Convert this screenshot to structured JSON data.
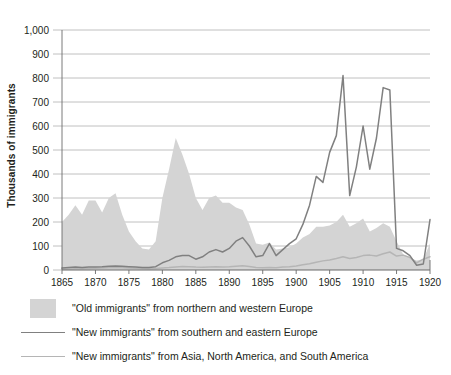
{
  "chart_data": {
    "type": "area",
    "title": "",
    "xlabel": "",
    "ylabel": "Thousands of immigrants",
    "xlim": [
      1865,
      1920
    ],
    "ylim": [
      0,
      1000
    ],
    "xticks": [
      1865,
      1870,
      1875,
      1880,
      1885,
      1890,
      1895,
      1900,
      1905,
      1910,
      1915,
      1920
    ],
    "yticks": [
      0,
      100,
      200,
      300,
      400,
      500,
      600,
      700,
      800,
      900,
      1000
    ],
    "ytick_labels": [
      "0",
      "100",
      "200",
      "300",
      "400",
      "500",
      "600",
      "700",
      "800",
      "900",
      "1,000"
    ],
    "xtick_labels": [
      "1865",
      "1870",
      "1875",
      "1880",
      "1885",
      "1890",
      "1895",
      "1900",
      "1905",
      "1910",
      "1915",
      "1920"
    ],
    "grid": true,
    "legend_position": "below",
    "colors": {
      "old_immigrants_area": "#d4d4d4",
      "new_immigrants_europe_line": "#808080",
      "new_immigrants_asia_americas_line": "#b5b5b5",
      "gridline": "#b0b0b0",
      "axis": "#6b6b6b",
      "text": "#231f20",
      "background": "#ffffff"
    },
    "x": [
      1865,
      1866,
      1867,
      1868,
      1869,
      1870,
      1871,
      1872,
      1873,
      1874,
      1875,
      1876,
      1877,
      1878,
      1879,
      1880,
      1881,
      1882,
      1883,
      1884,
      1885,
      1886,
      1887,
      1888,
      1889,
      1890,
      1891,
      1892,
      1893,
      1894,
      1895,
      1896,
      1897,
      1898,
      1899,
      1900,
      1901,
      1902,
      1903,
      1904,
      1905,
      1906,
      1907,
      1908,
      1909,
      1910,
      1911,
      1912,
      1913,
      1914,
      1915,
      1916,
      1917,
      1918,
      1919,
      1920
    ],
    "series": [
      {
        "name": "\"Old immigrants\" from northern and western Europe",
        "type": "area",
        "color": "#d4d4d4",
        "values": [
          200,
          230,
          270,
          230,
          290,
          290,
          240,
          300,
          320,
          230,
          160,
          120,
          90,
          85,
          120,
          300,
          420,
          550,
          480,
          400,
          300,
          250,
          300,
          310,
          280,
          280,
          260,
          250,
          190,
          110,
          105,
          115,
          85,
          90,
          95,
          110,
          135,
          150,
          180,
          180,
          185,
          200,
          230,
          180,
          195,
          215,
          160,
          175,
          195,
          180,
          120,
          65,
          50,
          40,
          45,
          110
        ]
      },
      {
        "name": "\"New immigrants\" from southern and eastern Europe",
        "type": "line",
        "color": "#808080",
        "values": [
          8,
          10,
          12,
          10,
          12,
          13,
          14,
          16,
          17,
          16,
          14,
          12,
          10,
          10,
          14,
          30,
          40,
          55,
          60,
          60,
          45,
          55,
          75,
          85,
          75,
          90,
          120,
          135,
          100,
          55,
          60,
          110,
          60,
          85,
          110,
          130,
          190,
          270,
          390,
          365,
          490,
          560,
          810,
          310,
          430,
          600,
          420,
          550,
          760,
          750,
          90,
          80,
          60,
          20,
          25,
          210
        ]
      },
      {
        "name": "\"New immigrants\" from Asia, North America, and South America",
        "type": "line",
        "color": "#b5b5b5",
        "values": [
          3,
          4,
          5,
          5,
          6,
          7,
          8,
          9,
          10,
          9,
          8,
          7,
          6,
          5,
          6,
          8,
          10,
          13,
          15,
          14,
          12,
          11,
          13,
          14,
          13,
          14,
          16,
          18,
          15,
          10,
          9,
          10,
          9,
          12,
          14,
          17,
          22,
          26,
          32,
          38,
          42,
          48,
          55,
          48,
          52,
          60,
          62,
          58,
          68,
          75,
          58,
          62,
          52,
          30,
          45,
          55
        ]
      }
    ]
  },
  "axis": {
    "y_title": "Thousands of immigrants"
  },
  "legend": {
    "items": [
      {
        "key_type": "area-swatch",
        "label": "\"Old immigrants\" from northern and western Europe",
        "color": "#d4d4d4"
      },
      {
        "key_type": "line-swatch",
        "label": "\"New immigrants\" from southern and eastern Europe",
        "color": "#808080"
      },
      {
        "key_type": "line-swatch",
        "label": "\"New immigrants\" from Asia, North America, and South America",
        "color": "#b5b5b5"
      }
    ]
  }
}
